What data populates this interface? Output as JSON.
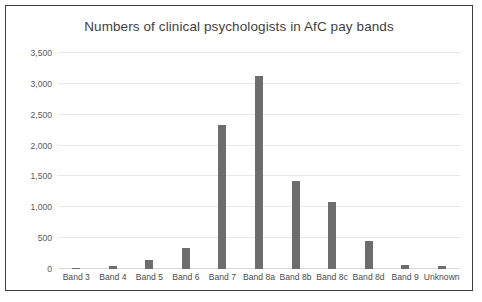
{
  "chart_data": {
    "type": "bar",
    "title": "Numbers of clinical psychologists in AfC pay bands",
    "xlabel": "",
    "ylabel": "",
    "categories": [
      "Band 3",
      "Band 4",
      "Band 5",
      "Band 6",
      "Band 7",
      "Band 8a",
      "Band 8b",
      "Band 8c",
      "Band 8d",
      "Band 9",
      "Unknown"
    ],
    "values": [
      10,
      50,
      150,
      340,
      2340,
      3130,
      1430,
      1090,
      460,
      70,
      55
    ],
    "ylim": [
      0,
      3500
    ],
    "ytick_values": [
      0,
      500,
      1000,
      1500,
      2000,
      2500,
      3000,
      3500
    ],
    "ytick_labels": [
      "0",
      "500",
      "1,000",
      "1,500",
      "2,000",
      "2,500",
      "3,000",
      "3,500"
    ],
    "grid": true,
    "legend": false,
    "bar_color": "#6d6d6d",
    "gridline_color": "#e8e8e8",
    "border_color": "#3b3b3b",
    "background_color": "#ffffff",
    "title_color": "#3f3f3f"
  }
}
